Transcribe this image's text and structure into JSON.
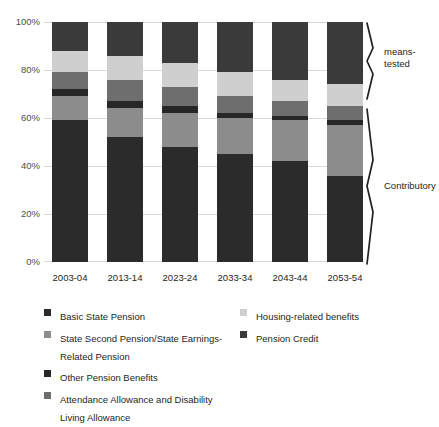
{
  "chart_data": {
    "type": "bar",
    "stacked": true,
    "stack_mode": "percent",
    "title": "",
    "subtitle": "",
    "xlabel": "",
    "ylabel": "",
    "ylim": [
      0,
      100
    ],
    "ytick_labels": [
      "0%",
      "20%",
      "40%",
      "60%",
      "80%",
      "100%"
    ],
    "ytick_values": [
      0,
      20,
      40,
      60,
      80,
      100
    ],
    "grid": true,
    "legend_position": "below",
    "categories": [
      "2003-04",
      "2013-14",
      "2023-24",
      "2033-34",
      "2043-44",
      "2053-54"
    ],
    "series": [
      {
        "name": "Basic State Pension",
        "color": "#2b2b2b",
        "values": [
          59,
          52,
          48,
          45,
          42,
          36
        ]
      },
      {
        "name": "State Second Pension/State Earnings-Related Pension",
        "color": "#8c8c8c",
        "values": [
          10,
          12,
          14,
          15,
          17,
          21
        ]
      },
      {
        "name": "Other Pension Benefits",
        "color": "#272727",
        "values": [
          3,
          3,
          3,
          2,
          2,
          2
        ]
      },
      {
        "name": "Attendance Allowance and Disability Living Allowance",
        "color": "#6e6e6e",
        "values": [
          7,
          9,
          8,
          7,
          6,
          6
        ]
      },
      {
        "name": "Housing-related benefits",
        "color": "#cfcfcf",
        "values": [
          9,
          10,
          10,
          10,
          9,
          9
        ]
      },
      {
        "name": "Pension Credit",
        "color": "#3a3a3a",
        "values": [
          12,
          14,
          17,
          21,
          24,
          26
        ]
      }
    ],
    "annotations": [
      {
        "label": "means-\ntested",
        "label_line1": "means-",
        "label_line2": "tested"
      },
      {
        "label": "Contributory",
        "label_line1": "Contributory",
        "label_line2": ""
      }
    ]
  },
  "legend": {
    "left_column": [
      {
        "label": "Basic State Pension",
        "color": "#2b2b2b"
      },
      {
        "label": "State Second Pension/State Earnings-Related Pension",
        "color": "#8c8c8c"
      },
      {
        "label": "Other Pension Benefits",
        "color": "#272727"
      },
      {
        "label": "Attendance Allowance and Disability Living Allowance",
        "color": "#6e6e6e"
      }
    ],
    "right_column": [
      {
        "label": "Housing-related benefits",
        "color": "#cfcfcf"
      },
      {
        "label": "Pension Credit",
        "color": "#3a3a3a"
      }
    ]
  },
  "brackets": {
    "means_tested": "means-tested",
    "means_tested_line1": "means-",
    "means_tested_line2": "tested",
    "contributory": "Contributory"
  }
}
